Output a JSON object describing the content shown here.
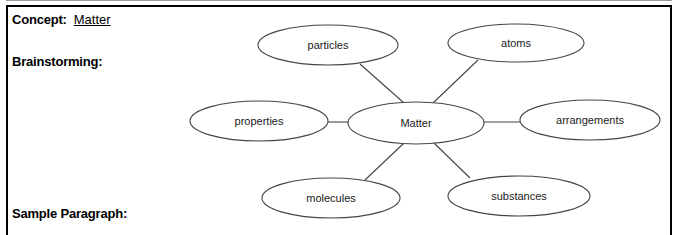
{
  "worksheet": {
    "concept_label": "Concept:",
    "concept_value": "Matter",
    "brainstorming_label": "Brainstorming:",
    "sample_paragraph_label": "Sample Paragraph:"
  },
  "concept_map": {
    "center": {
      "label": "Matter",
      "cx": 416,
      "cy": 123,
      "rx": 68,
      "ry": 21
    },
    "nodes": [
      {
        "id": "particles",
        "label": "particles",
        "cx": 328,
        "cy": 45,
        "rx": 70,
        "ry": 20
      },
      {
        "id": "atoms",
        "label": "atoms",
        "cx": 516,
        "cy": 43,
        "rx": 68,
        "ry": 19
      },
      {
        "id": "properties",
        "label": "properties",
        "cx": 259,
        "cy": 121,
        "rx": 69,
        "ry": 20
      },
      {
        "id": "arrangements",
        "label": "arrangements",
        "cx": 590,
        "cy": 120,
        "rx": 70,
        "ry": 20
      },
      {
        "id": "molecules",
        "label": "molecules",
        "cx": 331,
        "cy": 198,
        "rx": 69,
        "ry": 20
      },
      {
        "id": "substances",
        "label": "substances",
        "cx": 519,
        "cy": 196,
        "rx": 71,
        "ry": 20
      }
    ],
    "connectors": [
      {
        "from": "center",
        "to": "particles",
        "x1": 404,
        "y1": 103,
        "x2": 360,
        "y2": 64
      },
      {
        "from": "center",
        "to": "atoms",
        "x1": 433,
        "y1": 103,
        "x2": 478,
        "y2": 60
      },
      {
        "from": "center",
        "to": "properties",
        "x1": 348,
        "y1": 122,
        "x2": 328,
        "y2": 122
      },
      {
        "from": "center",
        "to": "arrangements",
        "x1": 484,
        "y1": 122,
        "x2": 520,
        "y2": 122
      },
      {
        "from": "center",
        "to": "molecules",
        "x1": 404,
        "y1": 143,
        "x2": 365,
        "y2": 180
      },
      {
        "from": "center",
        "to": "substances",
        "x1": 434,
        "y1": 143,
        "x2": 470,
        "y2": 178
      }
    ]
  },
  "colors": {
    "frame_border": "#000000",
    "node_stroke": "#444444",
    "text": "#000000",
    "node_text": "#1a1a1a"
  }
}
